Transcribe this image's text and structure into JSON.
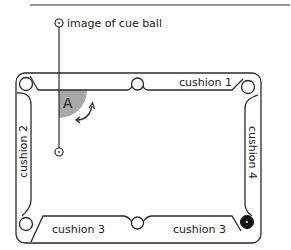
{
  "diagram": {
    "cue_ball_image_label": "image of cue ball",
    "angle_label": "A",
    "cushions": {
      "top": "cushion 1",
      "left": "cushion 2",
      "bottom_left": "cushion 3",
      "bottom_right": "cushion 3",
      "right": "cushion 4"
    },
    "colors": {
      "line": "#2a2a2a",
      "shade": "#a8a8a8",
      "background": "#ffffff",
      "pocket_filled": "#111111"
    }
  }
}
